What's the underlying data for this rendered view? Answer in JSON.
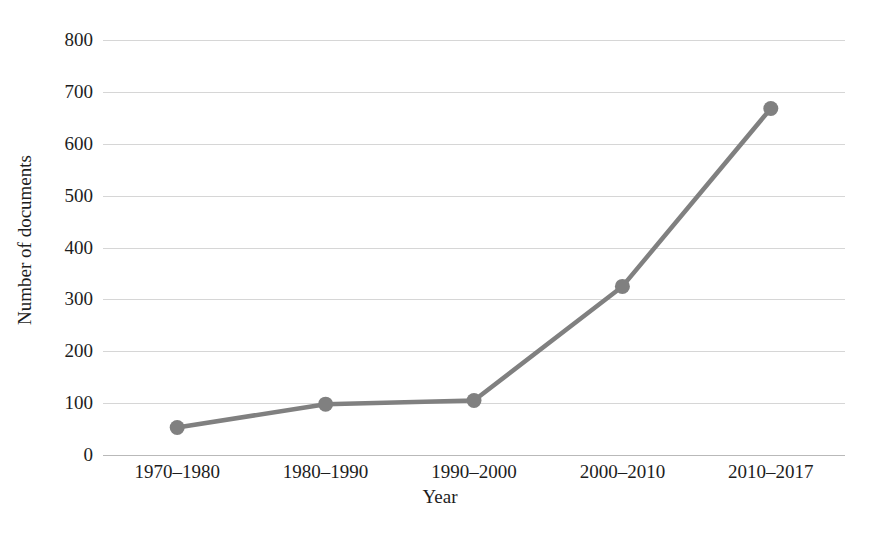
{
  "chart_data": {
    "type": "line",
    "title": "",
    "xlabel": "Year",
    "ylabel": "Number of documents",
    "categories": [
      "1970–1980",
      "1980–1990",
      "1990–2000",
      "2000–2010",
      "2010–2017"
    ],
    "values": [
      53,
      98,
      105,
      325,
      668
    ],
    "series": [
      {
        "name": "Number of documents",
        "values": [
          53,
          98,
          105,
          325,
          668
        ]
      }
    ],
    "ylim": [
      0,
      800
    ],
    "yticks": [
      0,
      100,
      200,
      300,
      400,
      500,
      600,
      700,
      800
    ],
    "ytick_labels": [
      "0",
      "100",
      "200",
      "300",
      "400",
      "500",
      "600",
      "700",
      "800"
    ],
    "grid": true,
    "grid_axis": "y",
    "legend": false,
    "legend_position": "none",
    "marker": "circle",
    "line_color": "#808080",
    "marker_color": "#808080",
    "grid_color": "#d6d6d6",
    "axis_color": "#b9b9b9",
    "text_color": "#1d1d1d",
    "background_color": "#ffffff"
  }
}
